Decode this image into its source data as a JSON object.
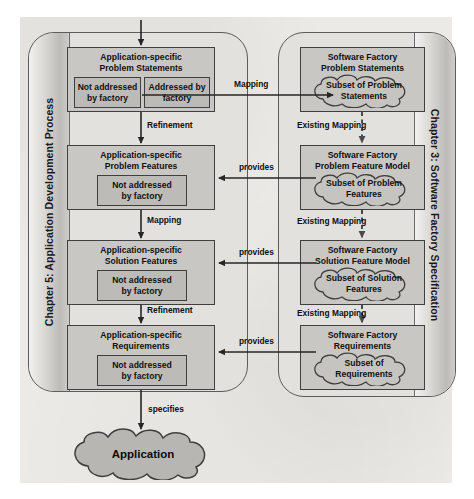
{
  "diagram": {
    "lanes": {
      "left": {
        "label": "Chapter 5: Application Development Process"
      },
      "right": {
        "label": "Chapter 3: Software Factory Specification"
      }
    },
    "left_boxes": [
      {
        "title_line1": "Application-specific",
        "title_line2": "Problem Statements",
        "sub": [
          {
            "line1": "Not addressed",
            "line2": "by factory"
          },
          {
            "line1": "Addressed by",
            "line2": "factory"
          }
        ]
      },
      {
        "title_line1": "Application-specific",
        "title_line2": "Problem Features",
        "sub": [
          {
            "line1": "Not addressed",
            "line2": "by factory"
          }
        ]
      },
      {
        "title_line1": "Application-specific",
        "title_line2": "Solution Features",
        "sub": [
          {
            "line1": "Not addressed",
            "line2": "by factory"
          }
        ]
      },
      {
        "title_line1": "Application-specific",
        "title_line2": "Requirements",
        "sub": [
          {
            "line1": "Not addressed",
            "line2": "by factory"
          }
        ]
      }
    ],
    "right_boxes": [
      {
        "title_line1": "Software Factory",
        "title_line2": "Problem Statements",
        "cloud_line1": "Subset of Problem",
        "cloud_line2": "Statements"
      },
      {
        "title_line1": "Software Factory",
        "title_line2": "Problem Feature Model",
        "cloud_line1": "Subset of Problem",
        "cloud_line2": "Features"
      },
      {
        "title_line1": "Software Factory",
        "title_line2": "Solution Feature Model",
        "cloud_line1": "Subset of Solution",
        "cloud_line2": "Features"
      },
      {
        "title_line1": "Software Factory",
        "title_line2": "Requirements",
        "cloud_line1": "Subset of",
        "cloud_line2": "Requirements"
      }
    ],
    "left_flow_labels": [
      "Refinement",
      "Mapping",
      "Refinement"
    ],
    "cross_labels": [
      "Mapping",
      "provides",
      "provides",
      "provides"
    ],
    "right_flow_labels": [
      "Existing Mapping",
      "Existing Mapping",
      "Existing Mapping"
    ],
    "output_label": "specifies",
    "output_node": "Application",
    "colors": {
      "paper": "#eceae6",
      "lane_fill": "#e3e1dd",
      "box_fill": "#c9c7c3",
      "subbox_fill": "#bdbbb7",
      "stroke": "#3f3f3f",
      "cloud_fill": "#c6c4c0"
    }
  }
}
